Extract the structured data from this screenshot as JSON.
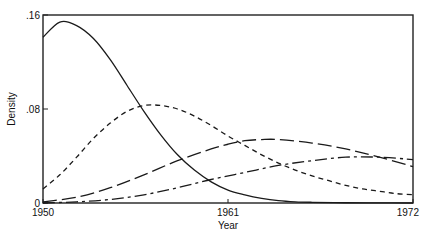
{
  "chart_data": {
    "type": "line",
    "title": "",
    "xlabel": "Year",
    "ylabel": "Density",
    "xlim": [
      1950,
      1972
    ],
    "ylim": [
      0,
      0.16
    ],
    "xticks": [
      {
        "value": 1950,
        "label": "1950"
      },
      {
        "value": 1961,
        "label": "1961"
      },
      {
        "value": 1972,
        "label": "1972"
      }
    ],
    "yticks": [
      {
        "value": 0,
        "label": "0"
      },
      {
        "value": 0.08,
        "label": ".08"
      },
      {
        "value": 0.16,
        "label": ".16"
      }
    ],
    "grid": false,
    "legend": null,
    "series": [
      {
        "name": "solid",
        "style": "solid",
        "x": [
          1950,
          1951,
          1952,
          1953,
          1954,
          1955,
          1956,
          1957,
          1958,
          1959,
          1960,
          1961,
          1962,
          1963,
          1964,
          1965,
          1966,
          1968,
          1970,
          1972
        ],
        "values": [
          0.141,
          0.154,
          0.151,
          0.14,
          0.122,
          0.1,
          0.078,
          0.058,
          0.041,
          0.028,
          0.018,
          0.011,
          0.007,
          0.004,
          0.002,
          0.001,
          0.0006,
          0.0002,
          0.0001,
          0.0
        ]
      },
      {
        "name": "short-dash",
        "style": "short-dash",
        "x": [
          1950,
          1951,
          1952,
          1953,
          1954,
          1955,
          1956,
          1957,
          1958,
          1959,
          1960,
          1961,
          1962,
          1963,
          1964,
          1965,
          1966,
          1967,
          1968,
          1969,
          1970,
          1971,
          1972
        ],
        "values": [
          0.012,
          0.024,
          0.039,
          0.055,
          0.068,
          0.078,
          0.083,
          0.083,
          0.08,
          0.074,
          0.066,
          0.057,
          0.049,
          0.041,
          0.034,
          0.028,
          0.023,
          0.019,
          0.015,
          0.012,
          0.01,
          0.008,
          0.007
        ]
      },
      {
        "name": "long-dash",
        "style": "long-dash",
        "x": [
          1950,
          1952,
          1954,
          1956,
          1958,
          1960,
          1961,
          1962,
          1963,
          1964,
          1966,
          1968,
          1970,
          1972
        ],
        "values": [
          0.001,
          0.005,
          0.013,
          0.024,
          0.036,
          0.046,
          0.05,
          0.053,
          0.054,
          0.054,
          0.051,
          0.046,
          0.039,
          0.031
        ]
      },
      {
        "name": "dash-dot",
        "style": "dash-dot",
        "x": [
          1950,
          1952,
          1954,
          1956,
          1958,
          1960,
          1962,
          1964,
          1966,
          1968,
          1970,
          1972
        ],
        "values": [
          0.0,
          0.001,
          0.003,
          0.007,
          0.013,
          0.02,
          0.026,
          0.032,
          0.036,
          0.039,
          0.039,
          0.037
        ]
      }
    ]
  },
  "colors": {
    "line": "#1a1a1a",
    "background": "#ffffff"
  }
}
